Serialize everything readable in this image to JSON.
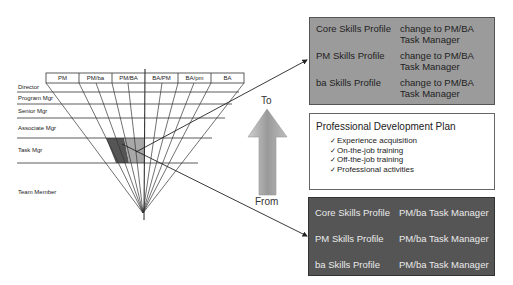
{
  "pyramid": {
    "columns": [
      "PM",
      "PM/ba",
      "PM/BA",
      "BA/PM",
      "BA/pm",
      "BA"
    ],
    "levels": [
      "Director",
      "Program Mgr",
      "Senior Mgr",
      "Associate Mgr",
      "Task Mgr",
      "Team Member"
    ]
  },
  "arrow": {
    "top_label": "To",
    "bottom_label": "From"
  },
  "target_box": {
    "rows": [
      {
        "profile": "Core Skills Profile",
        "change_line1": "change to PM/BA",
        "change_line2": "Task Manager"
      },
      {
        "profile": "PM Skills Profile",
        "change_line1": "change to PM/BA",
        "change_line2": "Task Manager"
      },
      {
        "profile": "ba Skills Profile",
        "change_line1": "change to PM/BA",
        "change_line2": "Task Manager"
      }
    ]
  },
  "development_plan": {
    "title": "Professional Development Plan",
    "check_glyph": "✓",
    "items": [
      "Experience acquisition",
      "On-the-job training",
      "Off-the-job training",
      "Professional activities"
    ]
  },
  "current_box": {
    "rows": [
      {
        "profile": "Core Skills Profile",
        "role": "PM/ba Task Manager"
      },
      {
        "profile": "PM Skills Profile",
        "role": "PM/ba Task Manager"
      },
      {
        "profile": "ba Skills Profile",
        "role": "PM/ba Task Manager"
      }
    ]
  },
  "colors": {
    "target_box_bg": "#9b9b9b",
    "current_box_bg": "#555555",
    "highlight_dark": "#555555",
    "highlight_light": "#a8a8a8"
  }
}
